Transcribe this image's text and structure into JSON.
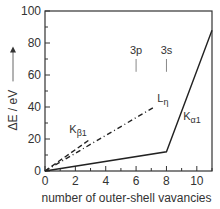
{
  "chart_data": {
    "type": "line",
    "title": "",
    "xlabel": "number of outer-shell vavancies",
    "ylabel": "ΔE / eV",
    "ylabel_arrow": "→",
    "xlim": [
      0,
      11
    ],
    "ylim": [
      0,
      100
    ],
    "xticks": [
      0,
      2,
      4,
      6,
      8,
      10
    ],
    "yticks": [
      0,
      20,
      40,
      60,
      80,
      100
    ],
    "x_minor_step": 1,
    "y_minor_step": 10,
    "grid": false,
    "series": [
      {
        "name": "Kα1",
        "label_main": "K",
        "label_sub": "α1",
        "style": "solid",
        "x": [
          0,
          8,
          11
        ],
        "y": [
          0,
          12,
          88
        ]
      },
      {
        "name": "Kβ1",
        "label_main": "K",
        "label_sub": "β1",
        "style": "dashed",
        "x": [
          0,
          3
        ],
        "y": [
          0,
          20
        ]
      },
      {
        "name": "Lη",
        "label_main": "L",
        "label_sub": "η",
        "style": "dashdot",
        "x": [
          0,
          7.2
        ],
        "y": [
          0,
          40
        ]
      }
    ],
    "annotations": [
      {
        "text": "3p",
        "x": 6,
        "y_from": 62,
        "y_to": 70
      },
      {
        "text": "3s",
        "x": 8,
        "y_from": 62,
        "y_to": 70
      }
    ]
  }
}
